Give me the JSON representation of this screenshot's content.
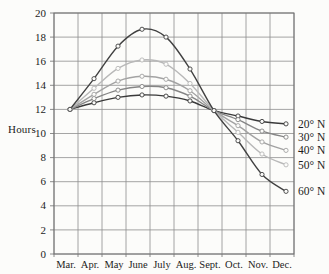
{
  "chart_data": {
    "type": "line",
    "title": "",
    "xlabel": "",
    "ylabel": "Hours",
    "x_tick_labels": [
      "Mar.",
      "Apr.",
      "May",
      "June",
      "July",
      "Aug.",
      "Sept.",
      "Oct.",
      "Nov.",
      "Dec."
    ],
    "x_points": [
      "Mar 21",
      "Apr 21",
      "May 21",
      "Jun 21",
      "Jul 21",
      "Aug 21",
      "Sep 21",
      "Oct 21",
      "Nov 21",
      "Dec 21"
    ],
    "y_ticks": [
      0,
      2,
      4,
      6,
      8,
      10,
      12,
      14,
      16,
      18,
      20
    ],
    "ylim": [
      0,
      20
    ],
    "grid": true,
    "legend_position": "right",
    "series": [
      {
        "id": "20n",
        "name": "20° N",
        "color": "#3a3a3a",
        "values": [
          12.0,
          12.55,
          13.0,
          13.2,
          13.1,
          12.7,
          11.9,
          11.45,
          11.0,
          10.8
        ]
      },
      {
        "id": "30n",
        "name": "30° N",
        "color": "#858585",
        "values": [
          12.0,
          12.9,
          13.6,
          13.9,
          13.8,
          13.1,
          11.9,
          11.15,
          10.2,
          9.7
        ]
      },
      {
        "id": "40n",
        "name": "40° N",
        "color": "#a3a3a3",
        "values": [
          12.0,
          13.25,
          14.35,
          14.75,
          14.5,
          13.55,
          11.9,
          10.65,
          9.3,
          8.6
        ]
      },
      {
        "id": "50n",
        "name": "50° N",
        "color": "#b8b8b8",
        "values": [
          12.0,
          13.75,
          15.4,
          16.1,
          15.75,
          14.15,
          11.9,
          10.1,
          8.3,
          7.4
        ]
      },
      {
        "id": "60n",
        "name": "60° N",
        "color": "#414141",
        "values": [
          12.0,
          14.55,
          17.25,
          18.65,
          18.0,
          15.35,
          11.9,
          9.4,
          6.6,
          5.2
        ]
      }
    ]
  }
}
